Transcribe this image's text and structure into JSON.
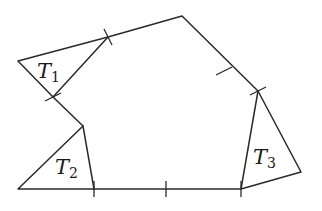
{
  "figure": {
    "colors": {
      "stroke": "#2a2a2a",
      "background": "#ffffff"
    },
    "labels": [
      {
        "id": "T1",
        "main": "T",
        "sub": "1"
      },
      {
        "id": "T2",
        "main": "T",
        "sub": "2"
      },
      {
        "id": "T3",
        "main": "T",
        "sub": "3"
      }
    ],
    "vertices": {
      "t1_left": [
        18,
        61
      ],
      "t1_top": [
        108,
        37
      ],
      "top_right": [
        182,
        16
      ],
      "t3_top": [
        258,
        91
      ],
      "t3_right": [
        301,
        172
      ],
      "bottom_right": [
        241,
        189
      ],
      "bottom_mid_tick": [
        166,
        189
      ],
      "t2_right": [
        94,
        189
      ],
      "t2_left": [
        18,
        189
      ],
      "notch": [
        83,
        126
      ],
      "t1_bottom": [
        53,
        97
      ]
    }
  }
}
